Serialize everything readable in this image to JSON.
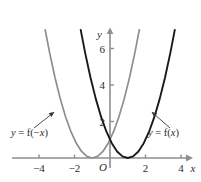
{
  "chart_data": {
    "type": "line",
    "title": "",
    "subtitle": "",
    "xlabel": "x",
    "ylabel": "y",
    "xlim": [
      -4.8,
      5.1
    ],
    "ylim": [
      -0.9,
      7.4
    ],
    "grid": false,
    "legend_position": "inline-annotations",
    "origin_label": "O",
    "xticks": [
      -4,
      -2,
      2,
      4
    ],
    "xtick_labels": [
      "−4",
      "−2",
      "2",
      "4"
    ],
    "yticks": [
      2,
      4,
      6
    ],
    "ytick_labels": [
      "2",
      "4",
      "6"
    ],
    "series": [
      {
        "name": "y = f(x)",
        "color": "#1a1a1a",
        "equation": "(x - 1)^2",
        "vertex": [
          1,
          0
        ],
        "x": [
          -1.65,
          -1.4,
          -1.1,
          -0.8,
          -0.5,
          -0.2,
          0.1,
          0.4,
          0.7,
          1.0,
          1.3,
          1.6,
          1.9,
          2.2,
          2.5,
          2.8,
          3.1,
          3.4,
          3.65
        ],
        "y": [
          7.02,
          5.76,
          4.41,
          3.24,
          2.25,
          1.44,
          0.81,
          0.36,
          0.09,
          0.0,
          0.09,
          0.36,
          0.81,
          1.44,
          2.25,
          3.24,
          4.41,
          5.76,
          7.02
        ]
      },
      {
        "name": "y = f(-x)",
        "color": "#8e8e8e",
        "equation": "(x + 1)^2",
        "vertex": [
          -1,
          0
        ],
        "x": [
          -3.65,
          -3.4,
          -3.1,
          -2.8,
          -2.5,
          -2.2,
          -1.9,
          -1.6,
          -1.3,
          -1.0,
          -0.7,
          -0.4,
          -0.1,
          0.2,
          0.5,
          0.8,
          1.1,
          1.4,
          1.65
        ],
        "y": [
          7.02,
          5.76,
          4.41,
          3.24,
          2.25,
          1.44,
          0.81,
          0.36,
          0.09,
          0.0,
          0.09,
          0.36,
          0.81,
          1.44,
          2.25,
          3.24,
          4.41,
          5.76,
          7.02
        ]
      }
    ],
    "annotations": [
      {
        "name": "label-f-neg-x",
        "text_parts": {
          "y": "y",
          "eq": " = f(−",
          "x": "x",
          "close": ")"
        },
        "full_text": "y = f(−x)",
        "color": "#2b2b2b",
        "points_to_series": "y = f(-x)"
      },
      {
        "name": "label-f-x",
        "text_parts": {
          "y": "y",
          "eq": " = f(",
          "x": "x",
          "close": ")"
        },
        "full_text": "y = f(x)",
        "color": "#2b2b2b",
        "points_to_series": "y = f(x)"
      }
    ],
    "colors": {
      "axis": "#8e8e8e",
      "curve_dark": "#1a1a1a",
      "curve_light": "#8e8e8e",
      "text": "#2b2b2b",
      "background": "#ffffff"
    }
  }
}
